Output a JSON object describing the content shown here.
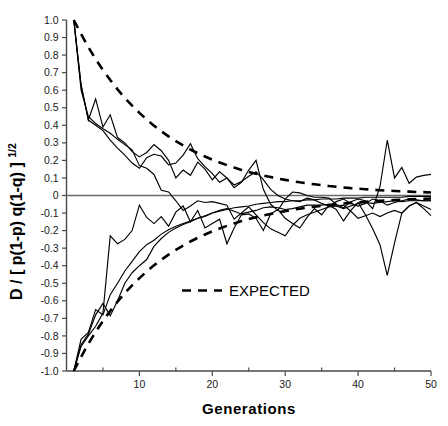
{
  "chart_data": {
    "type": "line",
    "title": "",
    "xlabel": "Generations",
    "ylabel": "D / [ p(1-p) q(1-q) ]",
    "ylabel_exponent": "1/2",
    "xlim": [
      0,
      50
    ],
    "ylim": [
      -1.0,
      1.0
    ],
    "grid": false,
    "legend_position": "center",
    "x_ticks": [
      10,
      20,
      30,
      40,
      50
    ],
    "x_tick_labels": [
      "10",
      "20",
      "30",
      "40",
      "50"
    ],
    "x_minor_ticks": [
      5,
      15,
      25,
      35,
      45
    ],
    "y_ticks": [
      1.0,
      0.9,
      0.8,
      0.7,
      0.6,
      0.5,
      0.4,
      0.3,
      0.2,
      0.1,
      0,
      -0.1,
      -0.2,
      -0.3,
      -0.4,
      -0.5,
      -0.6,
      -0.7,
      -0.8,
      -0.9,
      -1.0
    ],
    "y_tick_labels": [
      "1.0",
      "0.9",
      "0.8",
      "0.7",
      "0.6",
      "0.5",
      "0.4",
      "0.3",
      "0.2",
      "0.1",
      "0",
      "-0.1",
      "-0.2",
      "-0.3",
      "-0.4",
      "-0.5",
      "-0.6",
      "-0.7",
      "-0.8",
      "-0.9",
      "-1.0"
    ],
    "zero_reference_line": 0,
    "legend": [
      {
        "name": "EXPECTED",
        "style": "dashed"
      }
    ],
    "annotations": [
      {
        "text": "EXPECTED",
        "x": 26,
        "y": -0.48
      }
    ],
    "series": [
      {
        "name": "expected-upper",
        "style": "dashed",
        "x": [
          1,
          2,
          3,
          4,
          5,
          6,
          7,
          8,
          9,
          10,
          11,
          12,
          13,
          14,
          15,
          16,
          17,
          18,
          19,
          20,
          21,
          22,
          23,
          24,
          25,
          26,
          27,
          28,
          29,
          30,
          31,
          32,
          33,
          34,
          35,
          36,
          37,
          38,
          39,
          40,
          41,
          42,
          43,
          44,
          45,
          46,
          47,
          48,
          49,
          50
        ],
        "values": [
          1.0,
          0.92,
          0.845,
          0.777,
          0.715,
          0.658,
          0.605,
          0.556,
          0.512,
          0.471,
          0.433,
          0.398,
          0.366,
          0.337,
          0.31,
          0.285,
          0.262,
          0.241,
          0.222,
          0.204,
          0.188,
          0.173,
          0.159,
          0.146,
          0.134,
          0.124,
          0.114,
          0.105,
          0.096,
          0.089,
          0.082,
          0.075,
          0.069,
          0.064,
          0.059,
          0.054,
          0.05,
          0.046,
          0.042,
          0.039,
          0.036,
          0.033,
          0.03,
          0.028,
          0.026,
          0.024,
          0.022,
          0.02,
          0.019,
          0.017
        ]
      },
      {
        "name": "expected-lower",
        "style": "dashed",
        "x": [
          1,
          2,
          3,
          4,
          5,
          6,
          7,
          8,
          9,
          10,
          11,
          12,
          13,
          14,
          15,
          16,
          17,
          18,
          19,
          20,
          21,
          22,
          23,
          24,
          25,
          26,
          27,
          28,
          29,
          30,
          31,
          32,
          33,
          34,
          35,
          36,
          37,
          38,
          39,
          40,
          41,
          42,
          43,
          44,
          45,
          46,
          47,
          48,
          49,
          50
        ],
        "values": [
          -1.0,
          -0.92,
          -0.845,
          -0.777,
          -0.715,
          -0.658,
          -0.605,
          -0.556,
          -0.512,
          -0.471,
          -0.433,
          -0.398,
          -0.366,
          -0.337,
          -0.31,
          -0.285,
          -0.262,
          -0.241,
          -0.222,
          -0.204,
          -0.188,
          -0.173,
          -0.159,
          -0.146,
          -0.134,
          -0.124,
          -0.114,
          -0.105,
          -0.096,
          -0.089,
          -0.082,
          -0.075,
          -0.069,
          -0.064,
          -0.059,
          -0.054,
          -0.05,
          -0.046,
          -0.042,
          -0.039,
          -0.036,
          -0.033,
          -0.03,
          -0.028,
          -0.026,
          -0.024,
          -0.022,
          -0.02,
          -0.019,
          -0.017
        ]
      },
      {
        "name": "replicate-1",
        "style": "solid",
        "x": [
          1,
          2,
          3,
          4,
          5,
          6,
          7,
          8,
          9,
          10,
          11,
          12,
          13,
          14,
          15,
          16,
          17,
          18,
          19,
          20,
          21,
          22,
          23,
          24,
          25,
          26,
          27,
          28,
          29,
          30,
          31,
          32,
          33,
          34,
          35,
          36,
          37,
          38,
          39,
          40,
          41,
          42,
          43,
          44,
          45,
          46,
          47,
          48,
          49,
          50
        ],
        "values": [
          1.0,
          0.63,
          0.43,
          0.55,
          0.39,
          0.46,
          0.33,
          0.3,
          0.25,
          0.22,
          0.245,
          0.29,
          0.255,
          0.2,
          0.1,
          0.145,
          0.115,
          0.19,
          0.15,
          0.09,
          0.135,
          0.1,
          0.045,
          0.075,
          0.145,
          0.2,
          0.035,
          -0.05,
          -0.085,
          -0.02,
          0.02,
          0.015,
          0.0,
          -0.01,
          -0.01,
          -0.015,
          -0.05,
          -0.07,
          -0.035,
          -0.02,
          -0.03,
          -0.075,
          0.05,
          0.315,
          0.1,
          0.16,
          0.07,
          0.105,
          0.115,
          0.12
        ]
      },
      {
        "name": "replicate-2",
        "style": "solid",
        "x": [
          1,
          2,
          3,
          4,
          5,
          6,
          7,
          8,
          9,
          10,
          11,
          12,
          13,
          14,
          15,
          16,
          17,
          18,
          19,
          20,
          21,
          22,
          23,
          24,
          25,
          26,
          27,
          28,
          29,
          30,
          31,
          32,
          33,
          34,
          35,
          36,
          37,
          38,
          39,
          40,
          41,
          42,
          43,
          44,
          45,
          46,
          47,
          48,
          49,
          50
        ],
        "values": [
          1.0,
          0.6,
          0.45,
          0.41,
          0.38,
          0.355,
          0.32,
          0.29,
          0.26,
          0.17,
          0.155,
          0.12,
          0.03,
          0.02,
          -0.03,
          -0.085,
          -0.06,
          -0.03,
          -0.04,
          -0.035,
          -0.045,
          -0.055,
          -0.135,
          -0.1,
          -0.065,
          -0.11,
          -0.155,
          -0.19,
          -0.21,
          -0.23,
          -0.17,
          -0.13,
          -0.11,
          -0.095,
          -0.08,
          -0.065,
          -0.06,
          -0.055,
          -0.09,
          -0.13,
          -0.115,
          -0.1,
          -0.12,
          -0.1,
          -0.085,
          -0.1,
          -0.06,
          -0.04,
          -0.075,
          -0.115
        ]
      },
      {
        "name": "replicate-3",
        "style": "solid",
        "x": [
          1,
          2,
          3,
          4,
          5,
          6,
          7,
          8,
          9,
          10,
          11,
          12,
          13,
          14,
          15,
          16,
          17,
          18,
          19,
          20,
          21,
          22,
          23,
          24,
          25,
          26,
          27,
          28,
          29,
          30,
          31,
          32,
          33,
          34,
          35,
          36,
          37,
          38,
          39,
          40,
          41,
          42,
          43,
          44,
          45,
          46,
          47,
          48,
          49,
          50
        ],
        "values": [
          1.0,
          0.63,
          0.43,
          0.4,
          0.37,
          0.315,
          0.27,
          0.23,
          0.185,
          0.155,
          0.215,
          0.235,
          0.225,
          0.175,
          0.185,
          0.23,
          0.295,
          0.21,
          0.165,
          0.125,
          0.075,
          0.1,
          0.06,
          0.08,
          0.11,
          0.135,
          0.09,
          0.035,
          0.0,
          -0.02,
          -0.03,
          -0.035,
          -0.015,
          -0.025,
          -0.045,
          -0.06,
          -0.035,
          -0.02,
          -0.045,
          -0.06,
          -0.045,
          -0.02,
          -0.03,
          -0.055,
          -0.04,
          -0.03,
          -0.02,
          -0.025,
          -0.03,
          -0.03
        ]
      },
      {
        "name": "replicate-4",
        "style": "solid",
        "x": [
          1,
          2,
          3,
          4,
          5,
          6,
          7,
          8,
          9,
          10,
          11,
          12,
          13,
          14,
          15,
          16,
          17,
          18,
          19,
          20,
          21,
          22,
          23,
          24,
          25,
          26,
          27,
          28,
          29,
          30,
          31,
          32,
          33,
          34,
          35,
          36,
          37,
          38,
          39,
          40,
          41,
          42,
          43,
          44,
          45,
          46,
          47,
          48,
          49,
          50
        ],
        "values": [
          -1.0,
          -0.82,
          -0.78,
          -0.65,
          -0.68,
          -0.565,
          -0.5,
          -0.43,
          -0.375,
          -0.32,
          -0.28,
          -0.255,
          -0.22,
          -0.195,
          -0.175,
          -0.16,
          -0.145,
          -0.13,
          -0.12,
          -0.1,
          -0.085,
          -0.075,
          -0.09,
          -0.105,
          -0.095,
          -0.085,
          -0.07,
          -0.065,
          -0.07,
          -0.08,
          -0.075,
          -0.065,
          -0.055,
          -0.055,
          -0.055,
          -0.05,
          -0.06,
          -0.075,
          -0.06,
          -0.045,
          -0.04,
          -0.045,
          -0.04,
          -0.035,
          -0.03,
          -0.035,
          -0.03,
          -0.03,
          -0.03,
          -0.03
        ]
      },
      {
        "name": "replicate-5",
        "style": "solid",
        "x": [
          1,
          2,
          3,
          4,
          5,
          6,
          7,
          8,
          9,
          10,
          11,
          12,
          13,
          14,
          15,
          16,
          17,
          18,
          19,
          20,
          21,
          22,
          23,
          24,
          25,
          26,
          27,
          28,
          29,
          30,
          31,
          32,
          33,
          34,
          35,
          36,
          37,
          38,
          39,
          40,
          41,
          42,
          43,
          44,
          45,
          46,
          47,
          48,
          49,
          50
        ],
        "values": [
          -1.0,
          -0.85,
          -0.79,
          -0.68,
          -0.615,
          -0.685,
          -0.6,
          -0.5,
          -0.44,
          -0.4,
          -0.365,
          -0.29,
          -0.245,
          -0.21,
          -0.185,
          -0.165,
          -0.15,
          -0.13,
          -0.115,
          -0.1,
          -0.09,
          -0.08,
          -0.07,
          -0.065,
          -0.06,
          -0.05,
          -0.045,
          -0.04,
          -0.035,
          -0.035,
          -0.03,
          -0.03,
          -0.025,
          -0.025,
          -0.02,
          -0.02,
          -0.02,
          -0.015,
          -0.015,
          -0.015,
          -0.01,
          -0.01,
          -0.01,
          -0.01,
          -0.01,
          -0.01,
          -0.005,
          -0.005,
          -0.005,
          -0.005
        ]
      },
      {
        "name": "replicate-6",
        "style": "solid",
        "x": [
          1,
          2,
          3,
          4,
          5,
          6,
          7,
          8,
          9,
          10,
          11,
          12,
          13,
          14,
          15,
          16,
          17,
          18,
          19,
          20,
          21,
          22,
          23,
          24,
          25,
          26,
          27,
          28,
          29,
          30,
          31,
          32,
          33,
          34,
          35,
          36,
          37,
          38,
          39,
          40,
          41,
          42,
          43,
          44,
          45,
          46,
          47,
          48,
          49,
          50
        ],
        "values": [
          -1.0,
          -0.86,
          -0.8,
          -0.745,
          -0.67,
          -0.23,
          -0.275,
          -0.25,
          -0.2,
          -0.055,
          -0.125,
          -0.16,
          -0.12,
          -0.175,
          -0.095,
          -0.06,
          -0.15,
          -0.085,
          -0.185,
          -0.16,
          -0.135,
          -0.275,
          -0.185,
          -0.11,
          -0.105,
          -0.13,
          -0.2,
          -0.105,
          -0.08,
          -0.13,
          -0.16,
          -0.185,
          -0.125,
          -0.075,
          -0.11,
          -0.055,
          -0.08,
          -0.145,
          -0.085,
          -0.04,
          -0.11,
          -0.19,
          -0.28,
          -0.455,
          -0.27,
          -0.1,
          -0.06,
          -0.04,
          -0.06,
          -0.08
        ]
      }
    ]
  }
}
